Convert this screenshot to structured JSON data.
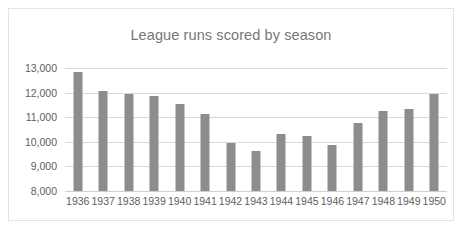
{
  "card": {
    "background": "#ffffff",
    "border_color": "#e3e3e3"
  },
  "chart_data": {
    "type": "bar",
    "title": "League runs scored by season",
    "xlabel": "",
    "ylabel": "",
    "categories": [
      "1936",
      "1937",
      "1938",
      "1939",
      "1940",
      "1941",
      "1942",
      "1943",
      "1944",
      "1945",
      "1946",
      "1947",
      "1948",
      "1949",
      "1950"
    ],
    "values": [
      12850,
      12060,
      11950,
      11880,
      11520,
      11150,
      9960,
      9640,
      10300,
      10230,
      9890,
      10780,
      11260,
      11340,
      11950
    ],
    "ylim": [
      8000,
      13000
    ],
    "y_ticks": [
      8000,
      9000,
      10000,
      11000,
      12000,
      13000
    ],
    "y_tick_labels": [
      "8,000",
      "9,000",
      "10,000",
      "11,000",
      "12,000",
      "13,000"
    ],
    "grid": true,
    "legend": false,
    "bar_color": "#8d8d8d",
    "gridline_color": "#d9d9d9",
    "axis_text_color": "#5e5e5e",
    "title_color": "#777777"
  }
}
